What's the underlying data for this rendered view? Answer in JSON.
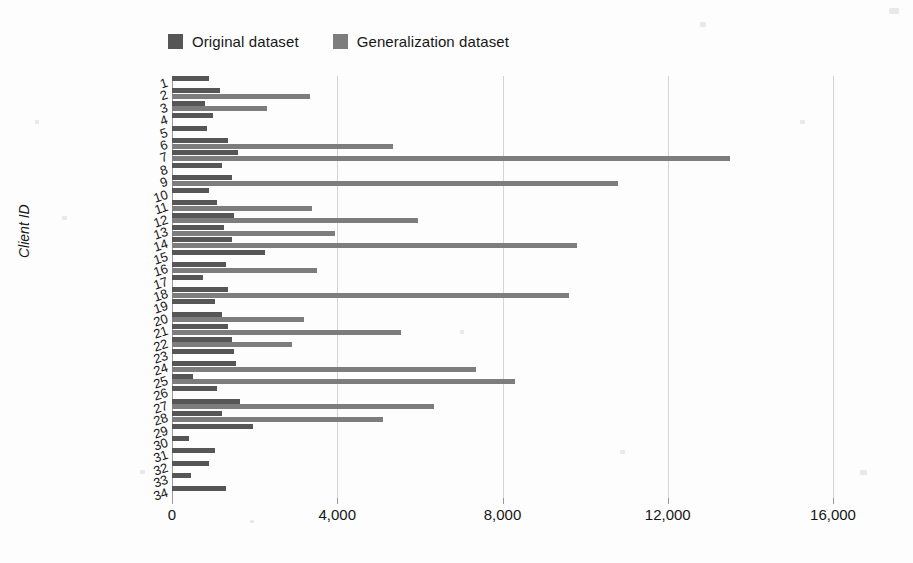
{
  "legend": {
    "items": [
      {
        "label": "Original dataset",
        "color": "#565656",
        "key": "original"
      },
      {
        "label": "Generalization dataset",
        "color": "#7d7d7d",
        "key": "generalization"
      }
    ]
  },
  "axes": {
    "y_title": "Client ID",
    "x_ticks": [
      "0",
      "4,000",
      "8,000",
      "12,000",
      "16,000"
    ],
    "x_tick_values": [
      0,
      4000,
      8000,
      12000,
      16000
    ]
  },
  "chart_data": {
    "type": "bar",
    "orientation": "horizontal",
    "title": "",
    "xlabel": "",
    "ylabel": "Client ID",
    "xlim": [
      0,
      16000
    ],
    "grid": true,
    "legend_position": "top-left",
    "categories": [
      "1",
      "2",
      "3",
      "4",
      "5",
      "6",
      "7",
      "8",
      "9",
      "10",
      "11",
      "12",
      "13",
      "14",
      "15",
      "16",
      "17",
      "18",
      "19",
      "20",
      "21",
      "22",
      "23",
      "24",
      "25",
      "26",
      "27",
      "28",
      "29",
      "30",
      "31",
      "32",
      "33",
      "34"
    ],
    "series": [
      {
        "name": "Original dataset",
        "color": "#565656",
        "values": [
          900,
          1150,
          800,
          1000,
          850,
          1350,
          1600,
          1200,
          1450,
          900,
          1100,
          1500,
          1250,
          1450,
          2250,
          1300,
          750,
          1350,
          1050,
          1200,
          1350,
          1450,
          1500,
          1550,
          500,
          1100,
          1650,
          1200,
          1950,
          400,
          1050,
          900,
          450,
          1300
        ]
      },
      {
        "name": "Generalization dataset",
        "color": "#7d7d7d",
        "values": [
          0,
          3350,
          2300,
          0,
          0,
          5350,
          13500,
          0,
          10800,
          0,
          3400,
          5950,
          3950,
          9800,
          0,
          3500,
          0,
          9600,
          0,
          3200,
          5550,
          2900,
          0,
          7350,
          8300,
          0,
          6350,
          5100,
          0,
          0,
          0,
          0,
          0,
          0
        ]
      }
    ]
  }
}
